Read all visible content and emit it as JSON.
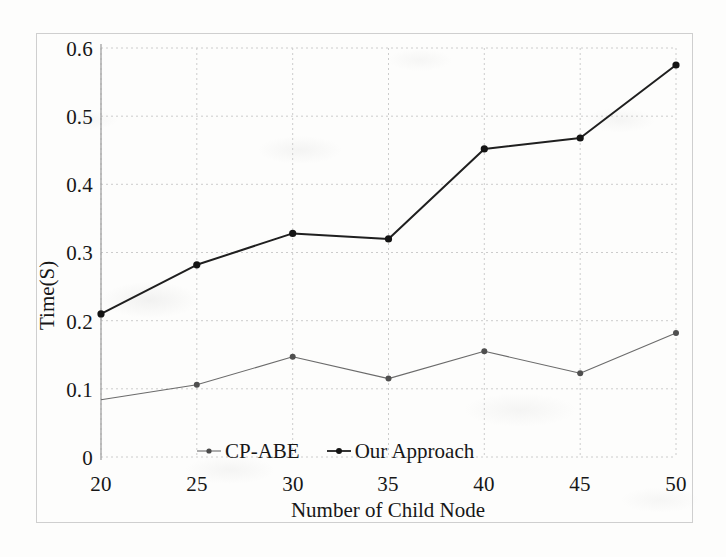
{
  "figure": {
    "kind": "line-chart-scan",
    "background_color": "#fdfdfc",
    "frame_color": "#cfcfcf",
    "ink_color": "#1a1a1a"
  },
  "chart_data": {
    "type": "line",
    "title": "",
    "subtitle": "",
    "xlabel": "Number of  Child Node",
    "ylabel": "Time(S)",
    "x": [
      20,
      25,
      30,
      35,
      40,
      45,
      50
    ],
    "categories": [
      "20",
      "25",
      "30",
      "35",
      "40",
      "45",
      "50"
    ],
    "xtick_labels": [
      "20",
      "25",
      "30",
      "35",
      "40",
      "45",
      "50"
    ],
    "ytick_labels": [
      "0",
      "0.1",
      "0.2",
      "0.3",
      "0.4",
      "0.5",
      "0.6"
    ],
    "ytick_values": [
      0,
      0.1,
      0.2,
      0.3,
      0.4,
      0.5,
      0.6
    ],
    "xlim": [
      20,
      50
    ],
    "ylim": [
      0,
      0.6
    ],
    "grid": true,
    "grid_style": "dotted",
    "legend_position": "inside-bottom-center",
    "marker": "filled-circle",
    "series": [
      {
        "name": "CP-ABE",
        "color": "#6b6b6b",
        "line_width": 1.1,
        "marker_size": 3.0,
        "values": [
          0.084,
          0.106,
          0.147,
          0.115,
          0.155,
          0.123,
          0.182
        ]
      },
      {
        "name": "Our Approach",
        "color": "#1f1f1f",
        "line_width": 2.0,
        "marker_size": 3.6,
        "values": [
          0.21,
          0.282,
          0.328,
          0.32,
          0.452,
          0.468,
          0.575
        ]
      }
    ]
  },
  "legend": {
    "items": [
      {
        "label": "CP-ABE",
        "swatch": "line-marker-swatch-light"
      },
      {
        "label": "Our Approach",
        "swatch": "line-marker-swatch-dark"
      }
    ]
  }
}
